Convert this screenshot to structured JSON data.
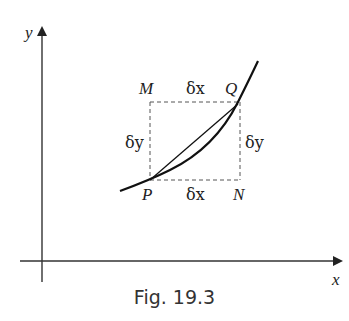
{
  "figure": {
    "caption": "Fig. 19.3",
    "axes": {
      "x_label": "x",
      "y_label": "y"
    },
    "points": {
      "P": "P",
      "Q": "Q",
      "M": "M",
      "N": "N"
    },
    "increments": {
      "top": "δx",
      "bottom": "δx",
      "left": "δy",
      "right": "δy"
    }
  }
}
